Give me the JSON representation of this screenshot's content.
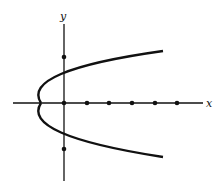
{
  "diagram": {
    "type": "graph",
    "axes": {
      "x_label": "x",
      "y_label": "y"
    },
    "x_axis_dots": [
      0,
      1,
      2,
      3,
      4,
      5
    ],
    "y_axis_dots": [
      2,
      -2
    ],
    "curve_points_on_y_axis": [
      1,
      -1
    ],
    "vertex": [
      -1,
      0
    ],
    "colors": {
      "ink": "#111111",
      "background": "#ffffff"
    }
  }
}
